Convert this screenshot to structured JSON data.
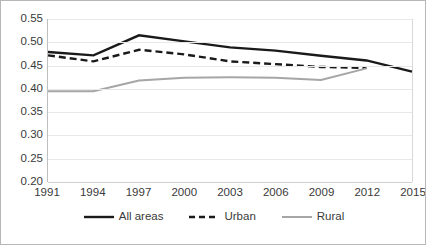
{
  "chart_data": {
    "type": "line",
    "title": "",
    "subtitle": "",
    "xlabel": "",
    "ylabel": "",
    "x": [
      1991,
      1994,
      1997,
      2000,
      2003,
      2006,
      2009,
      2012,
      2015
    ],
    "categories": [
      "1991",
      "1994",
      "1997",
      "2000",
      "2003",
      "2006",
      "2009",
      "2012",
      "2015"
    ],
    "xlim": [
      1991,
      2015
    ],
    "ylim": [
      0.2,
      0.55
    ],
    "ytick_labels": [
      "0.55",
      "0.50",
      "0.45",
      "0.40",
      "0.35",
      "0.30",
      "0.25",
      "0.20"
    ],
    "ytick_values": [
      0.55,
      0.5,
      0.45,
      0.4,
      0.35,
      0.3,
      0.25,
      0.2
    ],
    "ytick_step": 0.05,
    "grid": true,
    "grid_axis": "y",
    "legend_position": "bottom",
    "series": [
      {
        "name": "All areas",
        "style": "solid",
        "color": "#1a1a1a",
        "width": 2.4,
        "x": [
          1991,
          1994,
          1997,
          2000,
          2003,
          2006,
          2009,
          2012,
          2015
        ],
        "values": [
          0.479,
          0.472,
          0.515,
          0.502,
          0.489,
          0.482,
          0.471,
          0.461,
          0.437
        ]
      },
      {
        "name": "Urban",
        "style": "dashed",
        "color": "#1a1a1a",
        "width": 2.4,
        "x": [
          1991,
          1994,
          1997,
          2000,
          2003,
          2006,
          2009,
          2012
        ],
        "values": [
          0.472,
          0.459,
          0.484,
          0.474,
          0.459,
          0.453,
          0.447,
          0.445
        ]
      },
      {
        "name": "Rural",
        "style": "solid",
        "color": "#a6a6a6",
        "width": 2.0,
        "x": [
          1991,
          1994,
          1997,
          2000,
          2003,
          2006,
          2009,
          2012
        ],
        "values": [
          0.395,
          0.395,
          0.418,
          0.424,
          0.425,
          0.424,
          0.419,
          0.444
        ]
      }
    ]
  },
  "legend": {
    "items": [
      {
        "label": "All areas",
        "swatch": "solid-black-line-icon"
      },
      {
        "label": "Urban",
        "swatch": "dashed-black-line-icon"
      },
      {
        "label": "Rural",
        "swatch": "solid-gray-line-icon"
      }
    ]
  },
  "colors": {
    "all_areas": "#1a1a1a",
    "urban": "#1a1a1a",
    "rural": "#a6a6a6",
    "gridline": "#e8e8e8",
    "axis": "#bfbfbf",
    "text": "#3a3a3a",
    "border": "#b7b7b7",
    "background": "#ffffff"
  }
}
